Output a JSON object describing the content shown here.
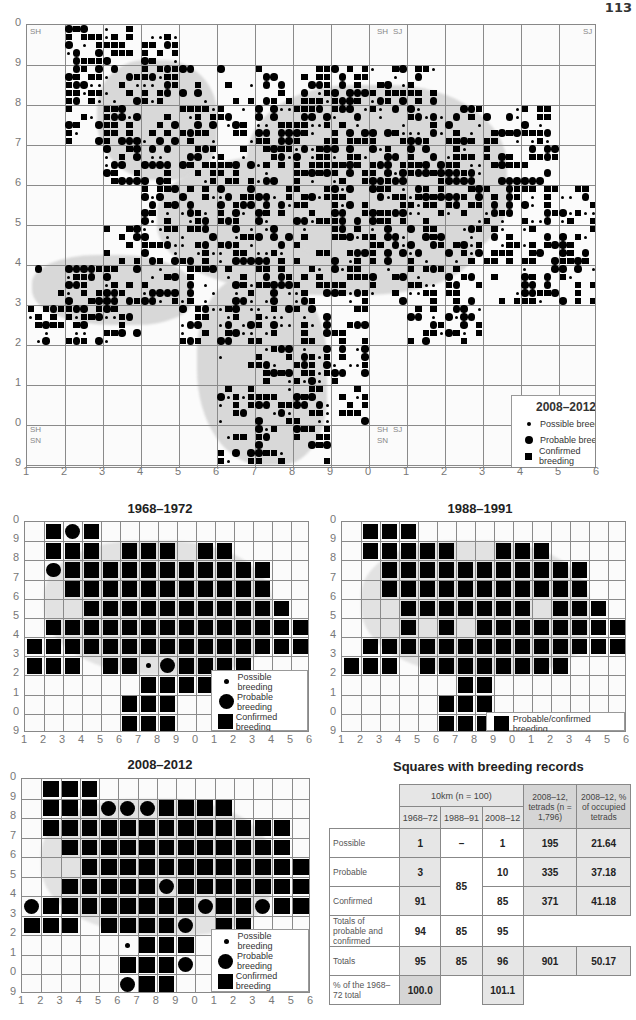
{
  "page": {
    "number": "113"
  },
  "main_map": {
    "title": "2008–2012",
    "y_labels": [
      "0",
      "9",
      "8",
      "7",
      "6",
      "5",
      "4",
      "3",
      "2",
      "1",
      "0",
      "9"
    ],
    "x_labels": [
      "1",
      "2",
      "3",
      "4",
      "5",
      "6",
      "7",
      "8",
      "9",
      "0",
      "1",
      "2",
      "3",
      "4",
      "5",
      "6"
    ],
    "grid_refs": {
      "top_left": "SH",
      "top_mid_left": "SH",
      "top_mid_right": "SJ",
      "top_right": "SJ",
      "bottom_left_top": "SH",
      "bottom_left_bottom": "SN",
      "bottom_mid_left": "SH",
      "bottom_mid_right": "SJ",
      "bottom_mid_below": "SN"
    },
    "legend": {
      "title": "2008–2012",
      "items": [
        "Possible breeding",
        "Probable breeding",
        "Confirmed breeding"
      ]
    }
  },
  "map_1968": {
    "title": "1968–1972",
    "y_labels": [
      "0",
      "9",
      "8",
      "7",
      "6",
      "5",
      "4",
      "3",
      "2",
      "1",
      "0",
      "9"
    ],
    "x_labels": [
      "1",
      "2",
      "3",
      "4",
      "5",
      "6",
      "7",
      "8",
      "9",
      "0",
      "1",
      "2",
      "3",
      "4",
      "5",
      "6"
    ],
    "legend": {
      "items": [
        "Possible breeding",
        "Probable breeding",
        "Confirmed breeding"
      ]
    },
    "cells": [
      "-CPC-----------",
      "-CCC-CCC-CC----",
      "-PCCCCCCCCCCC--",
      "--CCCCCCCCCCC--",
      "---CCCCCCCCCCC-",
      "-CCCCCCCCCCCCCC",
      "CCCCCCCCCCCCCCC",
      "CCC-CCoPCCCC---",
      "------CCCC-----",
      "-----CCC-------",
      "-----CCC-------"
    ]
  },
  "map_1988": {
    "title": "1988–1991",
    "y_labels": [
      "0",
      "9",
      "8",
      "7",
      "6",
      "5",
      "4",
      "3",
      "2",
      "1",
      "0",
      "9"
    ],
    "x_labels": [
      "1",
      "2",
      "3",
      "4",
      "5",
      "6",
      "7",
      "8",
      "9",
      "0",
      "1",
      "2",
      "3",
      "4",
      "5",
      "6"
    ],
    "legend": {
      "items": [
        "Probable/confirmed breeding"
      ]
    },
    "cells": [
      "-CCC-----------",
      "-CCCCC--CCC----",
      "--CCCCCCCCCCC--",
      "--CCCCCCCCCCC--",
      "---CCCCCCC-CCC-",
      "---C-C-CCCCCCCC",
      "-CCCCCCCCCCCCCC",
      "CCC-CCCCCCCC---",
      "------CC-------",
      "-----CCC-------",
      "-----CCC-------"
    ]
  },
  "map_2008": {
    "title": "2008–2012",
    "y_labels": [
      "0",
      "9",
      "8",
      "7",
      "6",
      "5",
      "4",
      "3",
      "2",
      "1",
      "0",
      "9"
    ],
    "x_labels": [
      "1",
      "2",
      "3",
      "4",
      "5",
      "6",
      "7",
      "8",
      "9",
      "0",
      "1",
      "2",
      "3",
      "4",
      "5",
      "6"
    ],
    "legend": {
      "items": [
        "Possible breeding",
        "Probable breeding",
        "Confirmed breeding"
      ]
    },
    "cells": [
      "-CCC-----------",
      "-CCCPPPCCCC----",
      "-CCCCCCCCCCCCC-",
      "--CCCCCCCCCCCC-",
      "---CCCCCCCCCCCC",
      "--CCCCCPCCCCCCC",
      "PCCCCCCCCPCCPCC",
      "CCC-CCCCP-CC---",
      "-----oCCC------",
      "-----CCCP------",
      "-----PCC-------"
    ]
  },
  "breeding_table": {
    "title": "Squares with breeding records",
    "header": {
      "group_10km": "10km (n = 100)",
      "col_1968": "1968–72",
      "col_1988": "1988–91",
      "col_2008": "2008–12",
      "col_tetrads": "2008–12, tetrads (n = 1,796)",
      "col_pct": "2008–12, % of occupied tetrads"
    },
    "rows": [
      {
        "label": "Possible",
        "v1968": "1",
        "v1988": "–",
        "v2008": "1",
        "tetrads": "195",
        "pct": "21.64"
      },
      {
        "label": "Probable",
        "v1968": "3",
        "v1988": "85",
        "v2008": "10",
        "tetrads": "335",
        "pct": "37.18"
      },
      {
        "label": "Confirmed",
        "v1968": "91",
        "v1988": "",
        "v2008": "85",
        "tetrads": "371",
        "pct": "41.18"
      },
      {
        "label": "Totals of probable and confirmed",
        "v1968": "94",
        "v1988": "85",
        "v2008": "95",
        "tetrads": "",
        "pct": ""
      },
      {
        "label": "Totals",
        "v1968": "95",
        "v1988": "85",
        "v2008": "96",
        "tetrads": "901",
        "pct": "50.17"
      },
      {
        "label": "% of the 1968–72 total",
        "v1968": "100.0",
        "v1988": "",
        "v2008": "101.1",
        "tetrads": "",
        "pct": ""
      }
    ]
  },
  "colors": {
    "symbol": "#000000",
    "grid": "#8a8a8a",
    "land": "#d8d8d8",
    "table_shade_light": "#e6e6e6",
    "table_shade_dark": "#d5d5d5"
  }
}
